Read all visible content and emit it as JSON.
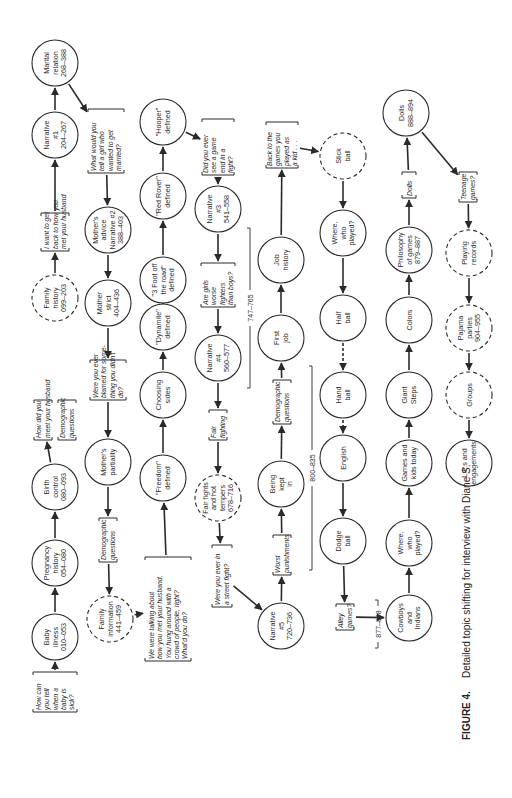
{
  "figure": {
    "caption_label": "FIGURE 4.",
    "caption_text": "Detailed topic shifting for interview with Diane S.",
    "orientation": "rotated-90-ccw"
  },
  "colors": {
    "ink": "#2a2a2a",
    "background": "#ffffff"
  },
  "nodes": [
    {
      "id": "n1",
      "type": "bracket",
      "x": 55,
      "y": 692,
      "w": 40,
      "h": 44,
      "lines": [
        "How can",
        "you tell",
        "when a",
        "baby is",
        "sick?"
      ]
    },
    {
      "id": "n2",
      "type": "circle",
      "x": 55,
      "y": 637,
      "r": 23,
      "lines": [
        "Baby",
        "illness",
        "010–053"
      ]
    },
    {
      "id": "n3",
      "type": "circle",
      "x": 55,
      "y": 563,
      "r": 23,
      "lines": [
        "Pregnancy",
        "history",
        "054–080"
      ]
    },
    {
      "id": "n4",
      "type": "circle",
      "x": 55,
      "y": 487,
      "r": 23,
      "lines": [
        "Birth",
        "control",
        "080–093"
      ]
    },
    {
      "id": "n5",
      "type": "bracket",
      "x": 43,
      "y": 420,
      "w": 40,
      "h": 18,
      "lines": [
        "How did you",
        "meet your husband"
      ]
    },
    {
      "id": "n5b",
      "type": "bracket",
      "x": 67,
      "y": 420,
      "w": 40,
      "h": 18,
      "lines": [
        "Demographic",
        "questions"
      ]
    },
    {
      "id": "n6",
      "type": "dashed",
      "x": 55,
      "y": 298,
      "r": 23,
      "lines": [
        "Family",
        "history",
        "099–203"
      ]
    },
    {
      "id": "n7",
      "type": "bracket",
      "x": 55,
      "y": 232,
      "w": 38,
      "h": 28,
      "lines": [
        "I want to get",
        "back to how you",
        "met your husband"
      ]
    },
    {
      "id": "n8",
      "type": "circle",
      "x": 55,
      "y": 135,
      "r": 23,
      "lines": [
        "Narrative",
        "#1",
        "204–267"
      ]
    },
    {
      "id": "n9",
      "type": "circle",
      "x": 55,
      "y": 63,
      "r": 23,
      "lines": [
        "Marital",
        "relation",
        "268–388"
      ]
    },
    {
      "id": "m1",
      "type": "bracket",
      "x": 106,
      "y": 141,
      "w": 64,
      "h": 36,
      "lines": [
        "What would you",
        "tell a girl who",
        "wanted to get",
        "married?"
      ]
    },
    {
      "id": "m2",
      "type": "circle",
      "x": 108,
      "y": 230,
      "r": 23,
      "lines": [
        "Mother's",
        "advice",
        "Narrative #2",
        "388–403"
      ]
    },
    {
      "id": "m3",
      "type": "circle",
      "x": 108,
      "y": 303,
      "r": 23,
      "lines": [
        "Mother",
        "strict",
        "404–436"
      ]
    },
    {
      "id": "m4",
      "type": "bracket",
      "x": 108,
      "y": 380,
      "w": 40,
      "h": 36,
      "lines": [
        "Were you ever",
        "blamed for some-",
        "thing you didn't",
        "do?"
      ]
    },
    {
      "id": "m5",
      "type": "circle",
      "x": 108,
      "y": 462,
      "r": 23,
      "lines": [
        "Mother's",
        "partiality"
      ]
    },
    {
      "id": "m6",
      "type": "bracket",
      "x": 108,
      "y": 540,
      "w": 44,
      "h": 18,
      "lines": [
        "Demographic",
        "questions"
      ]
    },
    {
      "id": "m7",
      "type": "dashed",
      "x": 110,
      "y": 619,
      "r": 23,
      "lines": [
        "Family",
        "information",
        "441–459"
      ]
    },
    {
      "id": "m8",
      "type": "bracket",
      "x": 168,
      "y": 609,
      "w": 104,
      "h": 46,
      "lines": [
        "We were talking about",
        "how you met your husband.",
        "You hung around with a",
        "crowd of people, right?",
        "What'd you do?"
      ]
    },
    {
      "id": "c1",
      "type": "circle",
      "x": 163,
      "y": 478,
      "r": 23,
      "lines": [
        "\"Freedom\"",
        "defined"
      ]
    },
    {
      "id": "c2",
      "type": "circle",
      "x": 163,
      "y": 395,
      "r": 23,
      "lines": [
        "Choosing",
        "sides"
      ]
    },
    {
      "id": "c3",
      "type": "circle",
      "x": 163,
      "y": 327,
      "r": 23,
      "lines": [
        "\"Dynamite\"",
        "defined"
      ]
    },
    {
      "id": "c4",
      "type": "circle",
      "x": 163,
      "y": 280,
      "r": 23,
      "lines": [
        "\"3 Foot off",
        "the road\"",
        "defined"
      ]
    },
    {
      "id": "c5",
      "type": "circle",
      "x": 163,
      "y": 196,
      "r": 23,
      "lines": [
        "\"Red Rover\"",
        "defined"
      ]
    },
    {
      "id": "c6",
      "type": "circle",
      "x": 163,
      "y": 122,
      "r": 23,
      "lines": [
        "\"Hooper\"",
        "defined"
      ]
    },
    {
      "id": "d1",
      "type": "bracket",
      "x": 218,
      "y": 147,
      "w": 56,
      "h": 32,
      "lines": [
        "Did you ever",
        "see a game",
        "end in a",
        "fight?"
      ]
    },
    {
      "id": "d2",
      "type": "circle",
      "x": 218,
      "y": 209,
      "r": 23,
      "lines": [
        "Narrative",
        "#3",
        "541–558"
      ]
    },
    {
      "id": "d3",
      "type": "bracket",
      "x": 218,
      "y": 285,
      "w": 44,
      "h": 34,
      "lines": [
        "Are girls",
        "worse",
        "fighters",
        "than boys?"
      ]
    },
    {
      "id": "d4",
      "type": "circle",
      "x": 218,
      "y": 358,
      "r": 23,
      "lines": [
        "Narrative",
        "#4",
        "560–577"
      ]
    },
    {
      "id": "d5",
      "type": "bracket",
      "x": 218,
      "y": 425,
      "w": 30,
      "h": 18,
      "lines": [
        "Fair",
        "fighting"
      ]
    },
    {
      "id": "d6",
      "type": "dashed",
      "x": 218,
      "y": 498,
      "r": 23,
      "lines": [
        "Fair fights",
        "and hot",
        "tempers",
        "678–716"
      ]
    },
    {
      "id": "d7",
      "type": "bracket",
      "x": 222,
      "y": 576,
      "w": 62,
      "h": 20,
      "lines": [
        "Were you ever in",
        "a street fight?"
      ]
    },
    {
      "id": "e1",
      "type": "circle",
      "x": 281,
      "y": 626,
      "r": 23,
      "lines": [
        "Narrative",
        "#5",
        "720–736"
      ]
    },
    {
      "id": "e2",
      "type": "bracket",
      "x": 282,
      "y": 555,
      "w": 40,
      "h": 18,
      "lines": [
        "Worst",
        "punishments"
      ]
    },
    {
      "id": "e3",
      "type": "circle",
      "x": 281,
      "y": 484,
      "r": 23,
      "lines": [
        "Being",
        "kept",
        "in"
      ]
    },
    {
      "id": "e4",
      "type": "bracket",
      "x": 282,
      "y": 402,
      "w": 44,
      "h": 18,
      "lines": [
        "Demographic",
        "questions"
      ]
    },
    {
      "id": "e5",
      "type": "circle",
      "x": 281,
      "y": 338,
      "r": 23,
      "lines": [
        "First",
        "job"
      ]
    },
    {
      "id": "e6",
      "type": "circle",
      "x": 281,
      "y": 260,
      "r": 23,
      "lines": [
        "Job",
        "history"
      ]
    },
    {
      "id": "e7",
      "type": "bracket",
      "x": 282,
      "y": 145,
      "w": 46,
      "h": 32,
      "lines": [
        "Back to the",
        "games you",
        "played as",
        "a kid . . ."
      ]
    },
    {
      "id": "f1",
      "type": "dashed",
      "x": 343,
      "y": 156,
      "r": 23,
      "lines": [
        "Stick",
        "ball"
      ]
    },
    {
      "id": "f2",
      "type": "circle",
      "x": 343,
      "y": 233,
      "r": 23,
      "lines": [
        "Where,",
        "who",
        "played?"
      ]
    },
    {
      "id": "f3",
      "type": "circle",
      "x": 343,
      "y": 318,
      "r": 23,
      "lines": [
        "Half",
        "ball"
      ]
    },
    {
      "id": "f4",
      "type": "circle",
      "x": 343,
      "y": 395,
      "r": 23,
      "lines": [
        "Hand",
        "ball"
      ]
    },
    {
      "id": "f5",
      "type": "circle",
      "x": 343,
      "y": 458,
      "r": 23,
      "lines": [
        "English"
      ]
    },
    {
      "id": "f6",
      "type": "circle",
      "x": 343,
      "y": 541,
      "r": 23,
      "lines": [
        "Dodge",
        "ball"
      ]
    },
    {
      "id": "f7",
      "type": "bracket",
      "x": 345,
      "y": 617,
      "w": 26,
      "h": 18,
      "lines": [
        "Alley",
        "games?"
      ]
    },
    {
      "id": "g1",
      "type": "circle",
      "x": 409,
      "y": 618,
      "r": 23,
      "lines": [
        "Cowboys",
        "and",
        "Indians"
      ]
    },
    {
      "id": "g2",
      "type": "circle",
      "x": 409,
      "y": 543,
      "r": 23,
      "lines": [
        "Where,",
        "who",
        "played?"
      ]
    },
    {
      "id": "g3",
      "type": "circle",
      "x": 409,
      "y": 463,
      "r": 23,
      "lines": [
        "Games and",
        "kids today"
      ]
    },
    {
      "id": "g4",
      "type": "circle",
      "x": 409,
      "y": 395,
      "r": 23,
      "lines": [
        "Giant",
        "Steps"
      ]
    },
    {
      "id": "g5",
      "type": "circle",
      "x": 409,
      "y": 320,
      "r": 23,
      "lines": [
        "Colors"
      ]
    },
    {
      "id": "g6",
      "type": "circle",
      "x": 409,
      "y": 250,
      "r": 23,
      "lines": [
        "Philosophy",
        "of games",
        "879–887"
      ]
    },
    {
      "id": "g7",
      "type": "bracket",
      "x": 409,
      "y": 185,
      "w": 26,
      "h": 14,
      "lines": [
        "Dolls"
      ]
    },
    {
      "id": "g8",
      "type": "circle",
      "x": 406,
      "y": 113,
      "r": 23,
      "lines": [
        "Dolls",
        "888–894"
      ]
    },
    {
      "id": "h1",
      "type": "bracket",
      "x": 468,
      "y": 187,
      "w": 30,
      "h": 18,
      "lines": [
        "Teenage",
        "games?"
      ]
    },
    {
      "id": "h2",
      "type": "dashed",
      "x": 469,
      "y": 253,
      "r": 23,
      "lines": [
        "Playing",
        "records"
      ]
    },
    {
      "id": "h3",
      "type": "dashed",
      "x": 469,
      "y": 328,
      "r": 23,
      "lines": [
        "Pajama",
        "parties",
        "904–955"
      ]
    },
    {
      "id": "h4",
      "type": "dashed",
      "x": 469,
      "y": 395,
      "r": 23,
      "lines": [
        "Groups"
      ]
    },
    {
      "id": "h5",
      "type": "circle",
      "x": 469,
      "y": 463,
      "r": 23,
      "lines": [
        "L.P.s and",
        "engagements"
      ]
    }
  ],
  "edges": [
    [
      "n1",
      "n2"
    ],
    [
      "n2",
      "n3"
    ],
    [
      "n3",
      "n4"
    ],
    [
      "n4",
      "n5"
    ],
    [
      "n6",
      "n7"
    ],
    [
      "n7",
      "n8"
    ],
    [
      "n8",
      "n9"
    ],
    [
      "n9",
      "m1"
    ],
    [
      "m1",
      "m2"
    ],
    [
      "m2",
      "m3"
    ],
    [
      "m3",
      "m4"
    ],
    [
      "m4",
      "m5"
    ],
    [
      "m5",
      "m6"
    ],
    [
      "m6",
      "m7"
    ],
    [
      "m7",
      "m8"
    ],
    [
      "m8",
      "c1"
    ],
    [
      "c1",
      "c2"
    ],
    [
      "c2",
      "c3"
    ],
    [
      "c3",
      "c4"
    ],
    [
      "c4",
      "c5"
    ],
    [
      "c5",
      "c6"
    ],
    [
      "c6",
      "d1"
    ],
    [
      "d1",
      "d2"
    ],
    [
      "d2",
      "d3"
    ],
    [
      "d3",
      "d4"
    ],
    [
      "d4",
      "d5"
    ],
    [
      "d5",
      "d6"
    ],
    [
      "d6",
      "d7"
    ],
    [
      "d7",
      "e1"
    ],
    [
      "e1",
      "e2"
    ],
    [
      "e2",
      "e3"
    ],
    [
      "e3",
      "e4"
    ],
    [
      "e4",
      "e5"
    ],
    [
      "e5",
      "e6"
    ],
    [
      "e6",
      "e7"
    ],
    [
      "e7",
      "f1"
    ],
    [
      "f1",
      "f2"
    ],
    [
      "f2",
      "f3"
    ],
    [
      "f3",
      "f4",
      "dashed"
    ],
    [
      "f4",
      "f5",
      "dashed"
    ],
    [
      "f5",
      "f6"
    ],
    [
      "f6",
      "f7"
    ],
    [
      "f7",
      "g1"
    ],
    [
      "g1",
      "g2"
    ],
    [
      "g2",
      "g3"
    ],
    [
      "g3",
      "g4"
    ],
    [
      "g4",
      "g5"
    ],
    [
      "g5",
      "g6"
    ],
    [
      "g6",
      "g7"
    ],
    [
      "g7",
      "g8"
    ],
    [
      "g8",
      "h1"
    ],
    [
      "h1",
      "h2"
    ],
    [
      "h2",
      "h3"
    ],
    [
      "h3",
      "h4"
    ],
    [
      "h4",
      "h5"
    ]
  ],
  "ranges": [
    {
      "label": "747–765",
      "x": 250,
      "y1": 228,
      "y2": 388
    },
    {
      "label": "800–835",
      "x": 312,
      "y1": 366,
      "y2": 570
    },
    {
      "label": "877–878",
      "x": 378,
      "y1": 600,
      "y2": 648
    }
  ]
}
